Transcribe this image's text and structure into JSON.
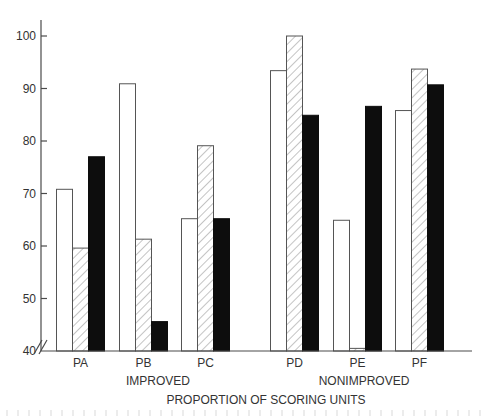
{
  "chart_data": {
    "type": "bar",
    "title": "",
    "xlabel": "PROPORTION OF SCORING UNITS",
    "ylabel": "",
    "ylim": [
      40,
      100
    ],
    "y_axis_break": true,
    "y_ticks": [
      40,
      50,
      60,
      70,
      80,
      90,
      100
    ],
    "grid": false,
    "legend": null,
    "categories": [
      "PA",
      "PB",
      "PC",
      "PD",
      "PE",
      "PF"
    ],
    "groups": [
      {
        "label": "IMPROVED",
        "categories": [
          "PA",
          "PB",
          "PC"
        ]
      },
      {
        "label": "NONIMPROVED",
        "categories": [
          "PD",
          "PE",
          "PF"
        ]
      }
    ],
    "series": [
      {
        "name": "white",
        "fill": "open",
        "values": [
          70.8,
          90.9,
          65.2,
          93.4,
          64.9,
          85.8
        ]
      },
      {
        "name": "hatched",
        "fill": "diagonal-hatch",
        "values": [
          59.6,
          61.3,
          79.1,
          100.0,
          40.5,
          93.7
        ]
      },
      {
        "name": "black",
        "fill": "solid-black",
        "values": [
          77.0,
          45.6,
          65.2,
          84.9,
          86.6,
          90.7
        ]
      }
    ]
  },
  "labels": {
    "x_title": "PROPORTION OF SCORING UNITS",
    "group_improved": "IMPROVED",
    "group_nonimproved": "NONIMPROVED"
  },
  "colors": {
    "axis": "#4a4a4a",
    "bar_outline": "#555555",
    "black_fill": "#0d0d0d",
    "hatch": "#8a8a8a"
  }
}
